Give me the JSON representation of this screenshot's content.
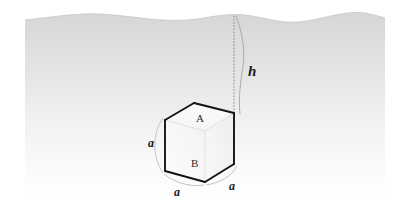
{
  "figure": {
    "background_color": "#ffffff",
    "water": {
      "name": "water-body",
      "fill_top_color": "#d9d9d9",
      "fill_bottom_color": "#ffffff",
      "left_x": 25,
      "right_x": 385,
      "surface_label": "",
      "surface_top_y": 12,
      "fade_bottom_y": 140
    },
    "cube": {
      "name": "cube",
      "edge_color": "#1a1a1a",
      "hidden_edge_color": "#9a9a9a",
      "face_fill": "#fbfbfb",
      "labels": {
        "top_face": "A",
        "bottom_face": "B",
        "edge_left": "a",
        "edge_bottom_left": "a",
        "edge_bottom_right": "a"
      }
    },
    "depth": {
      "name": "depth-dimension",
      "label": "h",
      "line_style": "dotted",
      "line_color": "#8a8a8a",
      "brace_color": "#9a9a9a",
      "from_y": 14,
      "to_y": 113
    }
  }
}
